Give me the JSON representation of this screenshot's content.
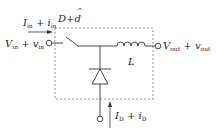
{
  "diagram": {
    "type": "buck-converter-switch-network",
    "labels": {
      "input_current": {
        "main": "I",
        "sub": "in",
        "plus": " + ",
        "main2": "i",
        "sub2": "in"
      },
      "duty": {
        "main": "D",
        "plus": "+",
        "hat": "^",
        "main2": "d"
      },
      "input_voltage": {
        "main": "V",
        "sub": "in",
        "plus": " + ",
        "main2": "v",
        "sub2": "in"
      },
      "output_voltage": {
        "main": "V",
        "sub": "out",
        "plus": " + ",
        "main2": "v",
        "sub2": "out"
      },
      "inductor": "L",
      "diode_current": {
        "main": "I",
        "sub": "D",
        "plus": " + ",
        "main2": "i",
        "sub2": "D"
      }
    },
    "colors": {
      "line": "#333333",
      "dash": "#777777",
      "text": "#222222"
    }
  }
}
